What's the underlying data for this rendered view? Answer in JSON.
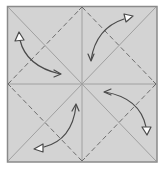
{
  "diagram": {
    "type": "origami-crease-pattern",
    "colors": {
      "paper_fill": "#d3d3d3",
      "border": "#8a8a8a",
      "crease_line": "#9c9c9c",
      "dashed_fold": "#6e6e6e",
      "arrow": "#4a4a4a",
      "arrow_head_fill": "#ffffff"
    },
    "square": {
      "x": 7,
      "y": 6,
      "size": 150,
      "height": 156
    },
    "center": {
      "x": 82,
      "y": 84
    },
    "creases": [
      {
        "name": "diagonal-tl-br",
        "style": "solid"
      },
      {
        "name": "diagonal-tr-bl",
        "style": "solid"
      },
      {
        "name": "vertical-center",
        "style": "solid"
      },
      {
        "name": "horizontal-center",
        "style": "solid"
      }
    ],
    "valley_folds": [
      {
        "name": "top-to-right",
        "style": "dashed"
      },
      {
        "name": "right-to-bottom",
        "style": "dashed"
      },
      {
        "name": "bottom-to-left",
        "style": "dashed"
      },
      {
        "name": "left-to-top",
        "style": "dashed"
      }
    ],
    "arrows": [
      {
        "name": "top-left-corner-fold",
        "from": "top-left corner",
        "to": "center"
      },
      {
        "name": "top-right-corner-fold",
        "from": "top-right corner",
        "to": "center"
      },
      {
        "name": "bottom-right-corner-fold",
        "from": "bottom-right corner",
        "to": "center"
      },
      {
        "name": "bottom-left-corner-fold",
        "from": "bottom-left corner",
        "to": "center"
      }
    ]
  }
}
